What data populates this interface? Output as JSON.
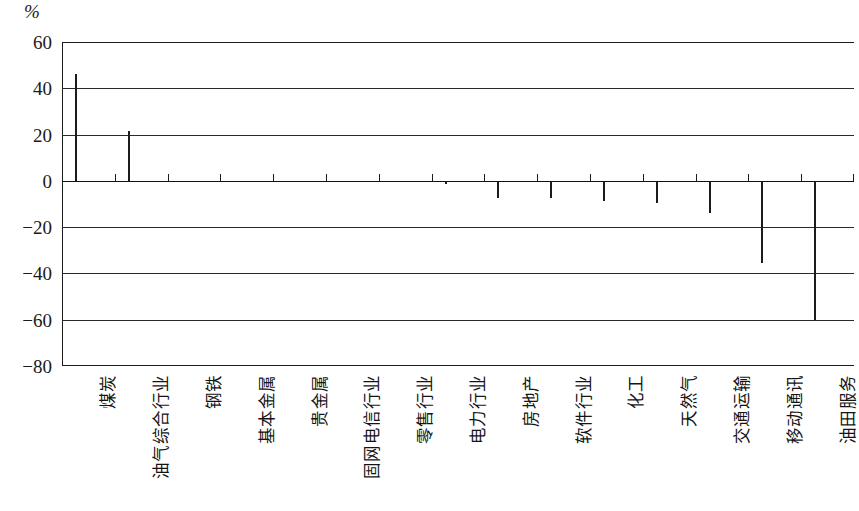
{
  "chart_data": {
    "type": "bar",
    "title": "",
    "subtitle": "",
    "xlabel": "",
    "ylabel": "%",
    "ylim": [
      -80,
      60
    ],
    "yticks": [
      60,
      40,
      20,
      0,
      -20,
      -40,
      -60,
      -80
    ],
    "ytick_labels": [
      "60",
      "40",
      "20",
      "0",
      "−20",
      "−40",
      "−60",
      "−80"
    ],
    "grid": true,
    "legend": null,
    "orientation": "vertical",
    "bar_color": "#d2d2d2",
    "bar_edge_color": "#1c1c1c",
    "categories": [
      "煤炭",
      "油气综合行业",
      "钢铁",
      "基本金属",
      "贵金属",
      "固网电信行业",
      "零售行业",
      "电力行业",
      "房地产",
      "软件行业",
      "化工",
      "天然气",
      "交通运输",
      "移动通讯",
      "油田服务"
    ],
    "values": [
      46,
      21.5,
      0,
      0,
      0,
      0,
      0,
      -1.5,
      -7.5,
      -7.5,
      -8.5,
      -9.5,
      -14,
      -35.5,
      -60
    ]
  },
  "axis": {
    "unit_label": "%"
  }
}
